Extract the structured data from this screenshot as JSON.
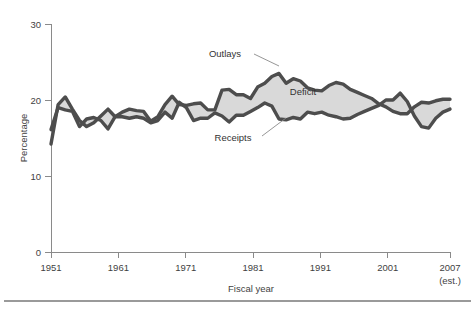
{
  "chart_data": {
    "type": "area",
    "title": "",
    "subtitle": "",
    "xlabel": "Fiscal year",
    "ylabel": "Percentage",
    "xlim": [
      1951,
      2007
    ],
    "ylim": [
      0,
      30
    ],
    "grid": false,
    "legend_position": "inline-annotations",
    "x_tick_labels": [
      "1951",
      "1961",
      "1971",
      "1981",
      "1991",
      "2001",
      "2007"
    ],
    "x_tick_values": [
      1951,
      1961,
      1971,
      1981,
      1991,
      2001,
      2007
    ],
    "x_tick_sublabel": "(est.)",
    "y_tick_labels": [
      "0",
      "10",
      "20",
      "30"
    ],
    "y_tick_values": [
      0,
      10,
      20,
      30
    ],
    "annotations": [
      {
        "text": "Outlays",
        "x": 1977,
        "y": 24.6
      },
      {
        "text": "Deficit",
        "x": 1988,
        "y": 21.1
      },
      {
        "text": "Receipts",
        "x": 1977,
        "y": 14.6
      }
    ],
    "fill_label": "Deficit",
    "x": [
      1951,
      1952,
      1953,
      1954,
      1955,
      1956,
      1957,
      1958,
      1959,
      1960,
      1961,
      1962,
      1963,
      1964,
      1965,
      1966,
      1967,
      1968,
      1969,
      1970,
      1971,
      1972,
      1973,
      1974,
      1975,
      1976,
      1977,
      1978,
      1979,
      1980,
      1981,
      1982,
      1983,
      1984,
      1985,
      1986,
      1987,
      1988,
      1989,
      1990,
      1991,
      1992,
      1993,
      1994,
      1995,
      1996,
      1997,
      1998,
      1999,
      2000,
      2001,
      2002,
      2003,
      2004,
      2005,
      2006,
      2007
    ],
    "series": [
      {
        "name": "Outlays",
        "color": "#4d4d4d",
        "values": [
          14.2,
          19.4,
          20.4,
          18.8,
          17.3,
          16.5,
          17.0,
          17.9,
          18.8,
          17.8,
          18.4,
          18.8,
          18.6,
          18.5,
          17.2,
          17.8,
          19.4,
          20.5,
          19.4,
          19.3,
          19.5,
          19.6,
          18.7,
          18.7,
          21.3,
          21.4,
          20.7,
          20.7,
          20.2,
          21.7,
          22.2,
          23.1,
          23.5,
          22.2,
          22.8,
          22.5,
          21.6,
          21.3,
          21.2,
          21.9,
          22.3,
          22.1,
          21.4,
          21.0,
          20.6,
          20.2,
          19.5,
          19.1,
          18.5,
          18.2,
          18.2,
          19.1,
          19.7,
          19.6,
          19.9,
          20.1,
          20.1
        ]
      },
      {
        "name": "Receipts",
        "color": "#4d4d4d",
        "values": [
          16.1,
          19.0,
          18.7,
          18.5,
          16.5,
          17.5,
          17.7,
          17.3,
          16.2,
          17.8,
          17.8,
          17.6,
          17.8,
          17.6,
          17.0,
          17.3,
          18.4,
          17.6,
          19.7,
          19.0,
          17.3,
          17.6,
          17.6,
          18.3,
          17.9,
          17.1,
          18.0,
          18.0,
          18.5,
          19.0,
          19.6,
          19.2,
          17.5,
          17.4,
          17.7,
          17.5,
          18.4,
          18.2,
          18.4,
          18.0,
          17.8,
          17.5,
          17.6,
          18.1,
          18.5,
          18.9,
          19.3,
          20.0,
          20.0,
          20.9,
          19.8,
          17.9,
          16.5,
          16.3,
          17.6,
          18.4,
          18.8
        ]
      }
    ]
  },
  "figure": {
    "plot_left": 51,
    "plot_right": 450,
    "plot_top": 24,
    "plot_bottom": 252
  }
}
